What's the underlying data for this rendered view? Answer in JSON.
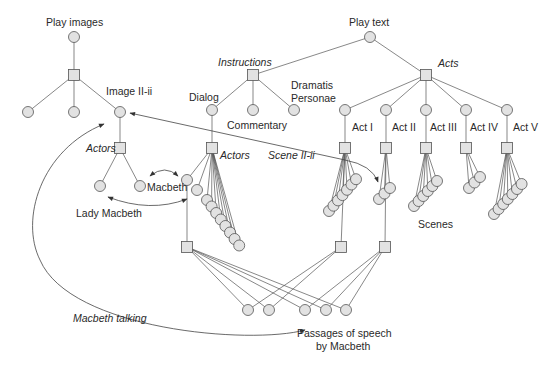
{
  "diagram": {
    "colors": {
      "node_fill": "#e2e2e2",
      "stroke": "#555555",
      "text": "#2a2a2a",
      "background": "#ffffff"
    },
    "labels": {
      "play_images": "Play images",
      "play_text": "Play text",
      "instructions": "Instructions",
      "acts": "Acts",
      "dramatis_1": "Dramatis",
      "dramatis_2": "Personae",
      "dialog": "Dialog",
      "commentary": "Commentary",
      "image_ii_ii": "Image II-ii",
      "actors_left": "Actors",
      "actors_dialog": "Actors",
      "scene_ii_ii": "Scene II-ii",
      "macbeth": "Macbeth",
      "lady_macbeth": "Lady Macbeth",
      "act_1": "Act I",
      "act_2": "Act II",
      "act_3": "Act III",
      "act_4": "Act IV",
      "act_5": "Act V",
      "scenes": "Scenes",
      "macbeth_talking": "Macbeth talking",
      "passages_1": "Passages of speech",
      "passages_2": "by Macbeth"
    },
    "nodes": {
      "circles": [
        {
          "id": "play-images",
          "x": 74,
          "y": 37
        },
        {
          "id": "img-1",
          "x": 28,
          "y": 112
        },
        {
          "id": "img-2",
          "x": 74,
          "y": 112
        },
        {
          "id": "image-ii-ii",
          "x": 120,
          "y": 112
        },
        {
          "id": "actor-lady",
          "x": 100,
          "y": 186
        },
        {
          "id": "actor-macbeth",
          "x": 140,
          "y": 186
        },
        {
          "id": "play-text",
          "x": 370,
          "y": 37
        },
        {
          "id": "dialog",
          "x": 212,
          "y": 110
        },
        {
          "id": "commentary",
          "x": 253,
          "y": 110
        },
        {
          "id": "dramatis",
          "x": 294,
          "y": 110
        },
        {
          "id": "act-1",
          "x": 345,
          "y": 110
        },
        {
          "id": "act-2",
          "x": 386,
          "y": 110
        },
        {
          "id": "act-3",
          "x": 426,
          "y": 110
        },
        {
          "id": "act-4",
          "x": 466,
          "y": 110
        },
        {
          "id": "act-5",
          "x": 507,
          "y": 110
        },
        {
          "id": "macbeth-actor",
          "x": 187,
          "y": 180
        },
        {
          "id": "lady-actor",
          "x": 197,
          "y": 190
        },
        {
          "id": "passage-1",
          "x": 248,
          "y": 310
        },
        {
          "id": "passage-2",
          "x": 269,
          "y": 310
        },
        {
          "id": "passage-3",
          "x": 305,
          "y": 310
        },
        {
          "id": "passage-4",
          "x": 326,
          "y": 310
        },
        {
          "id": "passage-5",
          "x": 346,
          "y": 310
        }
      ],
      "squares": [
        {
          "id": "play-images-hub",
          "x": 74,
          "y": 75
        },
        {
          "id": "actors-hub",
          "x": 120,
          "y": 148
        },
        {
          "id": "instructions-hub",
          "x": 253,
          "y": 75
        },
        {
          "id": "acts-hub",
          "x": 426,
          "y": 75
        },
        {
          "id": "dialog-actors-hub",
          "x": 212,
          "y": 148
        },
        {
          "id": "act-1-hub",
          "x": 345,
          "y": 148
        },
        {
          "id": "act-2-hub",
          "x": 386,
          "y": 148
        },
        {
          "id": "act-3-hub",
          "x": 426,
          "y": 148
        },
        {
          "id": "act-4-hub",
          "x": 466,
          "y": 148
        },
        {
          "id": "act-5-hub",
          "x": 507,
          "y": 148
        },
        {
          "id": "macbeth-hub",
          "x": 187,
          "y": 247
        },
        {
          "id": "scene-ii-ii-hub",
          "x": 341,
          "y": 247
        },
        {
          "id": "act-2-scene-hub",
          "x": 385,
          "y": 247
        }
      ]
    },
    "fans": [
      {
        "hub": "dialog-actors-hub",
        "hx": 212,
        "hy": 148,
        "x0": 207,
        "y0": 200,
        "dx": 4.6,
        "dy": 6.5,
        "n": 8
      },
      {
        "hub": "act-1-hub",
        "hx": 345,
        "hy": 148,
        "x0": 329,
        "y0": 211,
        "dx": 4.5,
        "dy": -5.3,
        "n": 7
      },
      {
        "hub": "act-2-hub",
        "hx": 386,
        "hy": 148,
        "x0": 379,
        "y0": 199,
        "dx": 5.5,
        "dy": -5.5,
        "n": 3
      },
      {
        "hub": "act-3-hub",
        "hx": 426,
        "hy": 148,
        "x0": 414,
        "y0": 206,
        "dx": 4.6,
        "dy": -5,
        "n": 6
      },
      {
        "hub": "act-4-hub",
        "hx": 466,
        "hy": 148,
        "x0": 469,
        "y0": 188,
        "dx": 5.5,
        "dy": -5.5,
        "n": 3
      },
      {
        "hub": "act-5-hub",
        "hx": 507,
        "hy": 148,
        "x0": 494,
        "y0": 214,
        "dx": 4.6,
        "dy": -5,
        "n": 7
      }
    ]
  }
}
